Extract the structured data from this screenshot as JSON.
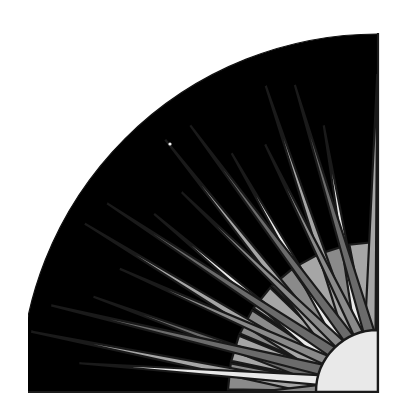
{
  "artwork": {
    "title": "Sunburst Quarter Circle",
    "subject": "stylized sun with radiating triangular rays",
    "style": "flat geometric grayscale, quarter-circle composition",
    "canvas": {
      "width": 406,
      "height": 419
    },
    "frame": {
      "left": 28,
      "right": 378,
      "top": 33,
      "bottom": 392,
      "stroke_color": "#1a1a1a"
    },
    "palette": {
      "sky": "#000000",
      "tone_white": "#e9e9e9",
      "tone_light": "#a6a6a6",
      "tone_mid": "#8a8a8a",
      "tone_dark": "#6b6b6b",
      "outline": "#1a1a1a",
      "paper": "#ffffff"
    },
    "sun": {
      "label": "sun-disc",
      "center_x": 378,
      "center_y": 392,
      "radius": 62,
      "fill": "#e9e9e9"
    },
    "sky": {
      "label": "night-sky-field",
      "center_x": 378,
      "center_y": 392,
      "outer_radius": 358,
      "fill": "#000000"
    },
    "speck": {
      "label": "star-speck",
      "cx": 170,
      "cy": 144,
      "r": 1.6,
      "fill": "#f2f2f2"
    },
    "rays": [
      {
        "name": "ray-01",
        "angle_deg": 2,
        "half_width_deg": 5.5,
        "length": 352,
        "skew": 0.55,
        "fill": "#a6a6a6"
      },
      {
        "name": "ray-02",
        "angle_deg": 2,
        "half_width_deg": 5.5,
        "length": 352,
        "skew": -0.45,
        "fill": "#8a8a8a"
      },
      {
        "name": "ray-03",
        "angle_deg": 12,
        "half_width_deg": 5.0,
        "length": 300,
        "skew": 0.5,
        "fill": "#6b6b6b"
      },
      {
        "name": "ray-04",
        "angle_deg": 12,
        "half_width_deg": 5.0,
        "length": 300,
        "skew": -0.5,
        "fill": "#e9e9e9"
      },
      {
        "name": "ray-05",
        "angle_deg": 22,
        "half_width_deg": 5.5,
        "length": 338,
        "skew": 0.55,
        "fill": "#a6a6a6"
      },
      {
        "name": "ray-06",
        "angle_deg": 22,
        "half_width_deg": 5.5,
        "length": 338,
        "skew": -0.5,
        "fill": "#6b6b6b"
      },
      {
        "name": "ray-07",
        "angle_deg": 32,
        "half_width_deg": 5.0,
        "length": 286,
        "skew": 0.5,
        "fill": "#e9e9e9"
      },
      {
        "name": "ray-08",
        "angle_deg": 32,
        "half_width_deg": 5.0,
        "length": 286,
        "skew": -0.5,
        "fill": "#8a8a8a"
      },
      {
        "name": "ray-09",
        "angle_deg": 42,
        "half_width_deg": 5.5,
        "length": 330,
        "skew": 0.55,
        "fill": "#a6a6a6"
      },
      {
        "name": "ray-10",
        "angle_deg": 42,
        "half_width_deg": 5.5,
        "length": 330,
        "skew": -0.5,
        "fill": "#6b6b6b"
      },
      {
        "name": "ray-11",
        "angle_deg": 52,
        "half_width_deg": 5.0,
        "length": 280,
        "skew": 0.5,
        "fill": "#e9e9e9"
      },
      {
        "name": "ray-12",
        "angle_deg": 52,
        "half_width_deg": 5.0,
        "length": 280,
        "skew": -0.5,
        "fill": "#8a8a8a"
      },
      {
        "name": "ray-13",
        "angle_deg": 62,
        "half_width_deg": 5.5,
        "length": 326,
        "skew": 0.55,
        "fill": "#a6a6a6"
      },
      {
        "name": "ray-14",
        "angle_deg": 62,
        "half_width_deg": 5.5,
        "length": 326,
        "skew": -0.5,
        "fill": "#6b6b6b"
      },
      {
        "name": "ray-15",
        "angle_deg": 72,
        "half_width_deg": 5.0,
        "length": 272,
        "skew": 0.5,
        "fill": "#e9e9e9"
      },
      {
        "name": "ray-16",
        "angle_deg": 72,
        "half_width_deg": 5.0,
        "length": 272,
        "skew": -0.5,
        "fill": "#8a8a8a"
      },
      {
        "name": "ray-17",
        "angle_deg": 82,
        "half_width_deg": 5.5,
        "length": 318,
        "skew": 0.55,
        "fill": "#a6a6a6"
      },
      {
        "name": "ray-18",
        "angle_deg": 82,
        "half_width_deg": 5.5,
        "length": 318,
        "skew": -0.5,
        "fill": "#6b6b6b"
      }
    ],
    "wedge_band": [
      {
        "name": "inner-wedge-01",
        "angle_deg": 6,
        "half_width_deg": 5.0,
        "inner": 62,
        "outer": 150,
        "fill": "#8a8a8a"
      },
      {
        "name": "inner-wedge-02",
        "angle_deg": 17,
        "half_width_deg": 5.0,
        "inner": 62,
        "outer": 150,
        "fill": "#a6a6a6"
      },
      {
        "name": "inner-wedge-03",
        "angle_deg": 28,
        "half_width_deg": 5.0,
        "inner": 62,
        "outer": 150,
        "fill": "#8a8a8a"
      },
      {
        "name": "inner-wedge-04",
        "angle_deg": 39,
        "half_width_deg": 5.0,
        "inner": 62,
        "outer": 150,
        "fill": "#a6a6a6"
      },
      {
        "name": "inner-wedge-05",
        "angle_deg": 50,
        "half_width_deg": 5.0,
        "inner": 62,
        "outer": 150,
        "fill": "#8a8a8a"
      },
      {
        "name": "inner-wedge-06",
        "angle_deg": 61,
        "half_width_deg": 5.0,
        "inner": 62,
        "outer": 150,
        "fill": "#a6a6a6"
      },
      {
        "name": "inner-wedge-07",
        "angle_deg": 72,
        "half_width_deg": 5.0,
        "inner": 62,
        "outer": 150,
        "fill": "#8a8a8a"
      },
      {
        "name": "inner-wedge-08",
        "angle_deg": 84,
        "half_width_deg": 5.0,
        "inner": 62,
        "outer": 150,
        "fill": "#a6a6a6"
      }
    ]
  }
}
